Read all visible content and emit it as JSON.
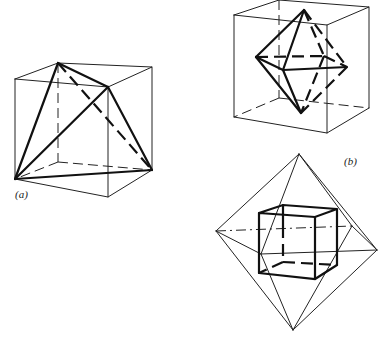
{
  "figures": [
    {
      "id": "a",
      "label": "(a)",
      "description": "Tetrahedron inscribed in a cube"
    },
    {
      "id": "b",
      "label": "(b)",
      "description": "Octahedron inscribed in a cube"
    },
    {
      "id": "c",
      "label": "",
      "description": "Cube inscribed in an octahedron"
    }
  ],
  "colors": {
    "line": "#111111",
    "background": "#ffffff"
  }
}
